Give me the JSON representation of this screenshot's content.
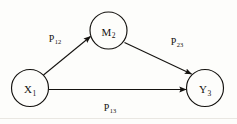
{
  "figure": {
    "type": "path-diagram",
    "background_color": "#fdfdfb",
    "stroke_color": "#14120f",
    "text_color": "#14120f",
    "width": 237,
    "height": 124
  },
  "nodes": [
    {
      "id": "x1",
      "symbol": "X",
      "subscript": "1",
      "label": "X1",
      "cx": 30,
      "cy": 88,
      "r": 18.5
    },
    {
      "id": "m2",
      "symbol": "M",
      "subscript": "2",
      "label": "M2",
      "cx": 108.5,
      "cy": 30.5,
      "r": 18.5
    },
    {
      "id": "y3",
      "symbol": "Y",
      "subscript": "3",
      "label": "Y3",
      "cx": 205,
      "cy": 88,
      "r": 18.5
    }
  ],
  "edges": [
    {
      "id": "p12",
      "symbol": "P",
      "subscript": "12",
      "label": "P12",
      "from": "x1",
      "to": "m2",
      "label_x": 55,
      "label_y": 38,
      "x1": 43.5,
      "y1": 75.0,
      "x2": 90.5,
      "y2": 36.5
    },
    {
      "id": "p23",
      "symbol": "P",
      "subscript": "23",
      "label": "P23",
      "from": "m2",
      "to": "y3",
      "label_x": 177,
      "label_y": 41,
      "x1": 124.5,
      "y1": 42.5,
      "x2": 191.5,
      "y2": 74.0
    },
    {
      "id": "p13",
      "symbol": "P",
      "subscript": "13",
      "label": "P13",
      "from": "x1",
      "to": "y3",
      "label_x": 110,
      "label_y": 107,
      "x1": 49.0,
      "y1": 89.5,
      "x2": 186.0,
      "y2": 89.5
    }
  ]
}
